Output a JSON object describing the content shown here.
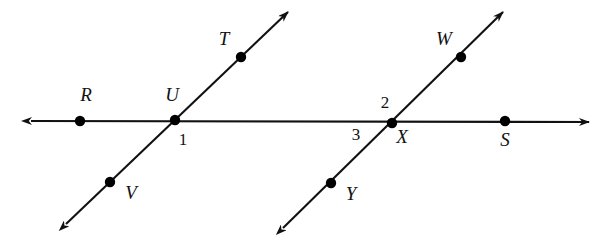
{
  "figure": {
    "background_color": "#ffffff",
    "stroke_color": "#111111",
    "point_color": "#000000",
    "width": 609,
    "height": 243
  },
  "lines": [
    {
      "name": "horizontal-line-RS",
      "kind": "double-arrow-line",
      "from": {
        "x": 31,
        "y": 121
      },
      "to": {
        "x": 589,
        "y": 122
      },
      "arrow_start": true,
      "arrow_end": true
    },
    {
      "name": "transversal-line-TV",
      "kind": "double-arrow-line",
      "from": {
        "x": 66,
        "y": 224
      },
      "to": {
        "x": 288,
        "y": 12
      },
      "arrow_start": true,
      "arrow_end": true
    },
    {
      "name": "transversal-line-WY",
      "kind": "double-arrow-line",
      "from": {
        "x": 283,
        "y": 228
      },
      "to": {
        "x": 503,
        "y": 12
      },
      "arrow_start": true,
      "arrow_end": true
    }
  ],
  "points": [
    {
      "id": "R",
      "label": "R",
      "x": 80,
      "y": 121,
      "label_x": 86,
      "label_y": 101,
      "anchor": "middle"
    },
    {
      "id": "U",
      "label": "U",
      "x": 175,
      "y": 120,
      "label_x": 172,
      "label_y": 101,
      "anchor": "middle"
    },
    {
      "id": "T",
      "label": "T",
      "x": 241,
      "y": 57,
      "label_x": 224,
      "label_y": 45,
      "anchor": "middle"
    },
    {
      "id": "V",
      "label": "V",
      "x": 110,
      "y": 182,
      "label_x": 131,
      "label_y": 199,
      "anchor": "middle"
    },
    {
      "id": "X",
      "label": "X",
      "x": 392,
      "y": 123,
      "label_x": 402,
      "label_y": 143,
      "anchor": "middle"
    },
    {
      "id": "W",
      "label": "W",
      "x": 461,
      "y": 57,
      "label_x": 444,
      "label_y": 45,
      "anchor": "middle"
    },
    {
      "id": "Y",
      "label": "Y",
      "x": 331,
      "y": 183,
      "label_x": 351,
      "label_y": 200,
      "anchor": "middle"
    },
    {
      "id": "S",
      "label": "S",
      "x": 505,
      "y": 121,
      "label_x": 505,
      "label_y": 146,
      "anchor": "middle"
    }
  ],
  "angle_labels": [
    {
      "id": "angle-1",
      "label": "1",
      "x": 183,
      "y": 145
    },
    {
      "id": "angle-2",
      "label": "2",
      "x": 385,
      "y": 108
    },
    {
      "id": "angle-3",
      "label": "3",
      "x": 356,
      "y": 140
    }
  ],
  "chart_data": {
    "type": "diagram",
    "intersections": [
      {
        "vertex": "U",
        "x": 175,
        "y": 120,
        "lines": [
          "horizontal-line-RS",
          "transversal-line-TV"
        ],
        "marked_angles": [
          "1"
        ]
      },
      {
        "vertex": "X",
        "x": 392,
        "y": 123,
        "lines": [
          "horizontal-line-RS",
          "transversal-line-WY"
        ],
        "marked_angles": [
          "2",
          "3"
        ]
      }
    ],
    "labels": [
      "R",
      "U",
      "T",
      "V",
      "X",
      "W",
      "Y",
      "S",
      "1",
      "2",
      "3"
    ]
  }
}
